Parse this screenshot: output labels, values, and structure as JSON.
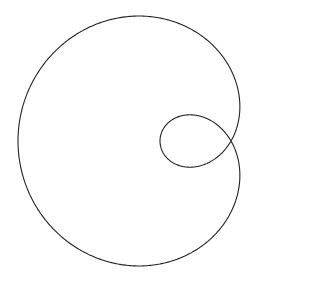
{
  "chart_data": {
    "type": "line",
    "title": "",
    "equation": "r = 71 - 142 cos(θ)",
    "a": 71,
    "b": 142,
    "pole_px": [
      231,
      141
    ],
    "samples": 720,
    "axes": false,
    "grid": false,
    "stroke_color": "#222222",
    "stroke_width": 1.1
  }
}
